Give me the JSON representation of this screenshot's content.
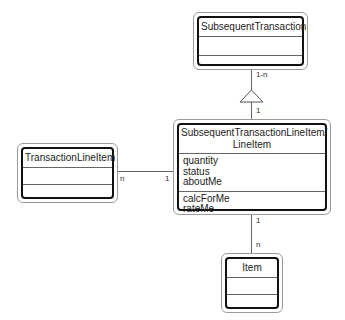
{
  "diagram": {
    "type": "UML class diagram",
    "classes": [
      {
        "id": "subsequent-transaction",
        "name": "SubsequentTransaction",
        "attributes": [],
        "operations": []
      },
      {
        "id": "subsequent-transaction-line-item",
        "name": "SubsequentTransactionLineItem/ LineItem",
        "name_line1": "SubsequentTransactionLineItem/",
        "name_line2": "LineItem",
        "attributes": [
          "quantity",
          "status",
          "aboutMe"
        ],
        "operations": [
          "calcForMe",
          "rateMe"
        ]
      },
      {
        "id": "transaction-line-item",
        "name": "TransactionLineItem",
        "attributes": [],
        "operations": []
      },
      {
        "id": "item",
        "name": "Item",
        "attributes": [],
        "operations": []
      }
    ],
    "relationships": [
      {
        "from": "SubsequentTransaction",
        "to": "SubsequentTransactionLineItem/LineItem",
        "kind": "aggregation-triangle",
        "from_multiplicity": "1-n",
        "to_multiplicity": "1"
      },
      {
        "from": "TransactionLineItem",
        "to": "SubsequentTransactionLineItem/LineItem",
        "kind": "association",
        "from_multiplicity": "n",
        "to_multiplicity": "1"
      },
      {
        "from": "SubsequentTransactionLineItem/LineItem",
        "to": "Item",
        "kind": "association",
        "from_multiplicity": "1",
        "to_multiplicity": "n"
      }
    ]
  },
  "colors": {
    "line": "#666666",
    "box_border": "#111111",
    "outer_border": "#9a9a9a",
    "background": "#ffffff"
  }
}
